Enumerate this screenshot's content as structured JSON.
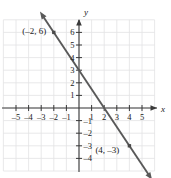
{
  "chart_data": {
    "type": "line",
    "title": "",
    "xlabel": "x",
    "ylabel": "y",
    "xlim": [
      -5.9,
      5.9
    ],
    "ylim": [
      -4.8,
      6.9
    ],
    "grid": true,
    "legend": null,
    "x_ticks": [
      -5,
      -4,
      -3,
      -2,
      -1,
      1,
      2,
      3,
      4,
      5
    ],
    "x_tick_labels": [
      "–5",
      "–4",
      "–3",
      "–2",
      "–1",
      "1",
      "2",
      "3",
      "4",
      "5"
    ],
    "y_ticks": [
      6,
      5,
      4,
      3,
      2,
      1,
      -1,
      -2,
      -3,
      -4
    ],
    "y_tick_labels": [
      "6",
      "5",
      "4",
      "3",
      "2",
      "1",
      "–1",
      "–2",
      "–3",
      "–4"
    ],
    "series": [
      {
        "name": "line",
        "kind": "line",
        "slope": -1.5,
        "intercept": 3,
        "x_start": -3.1,
        "y_start": 7.65,
        "x_end": 5.8,
        "y_end": -5.7,
        "arrows": "both",
        "color": "#595959"
      }
    ],
    "points": [
      {
        "x": -2,
        "y": 6,
        "label": "(–2, 6)",
        "label_x": -4.5,
        "label_y": 5.9
      },
      {
        "x": 4,
        "y": -3,
        "label": "(4, –3)",
        "label_x": 1.3,
        "label_y": -3.6
      }
    ],
    "annotations": []
  },
  "axes": {
    "x_axis_name": "x",
    "y_axis_name": "y"
  },
  "colors": {
    "grid": "#e2e2e4",
    "axis": "#3a3a3a",
    "line": "#5e5e5e",
    "text": "#1a1a1a",
    "background": "#ffffff"
  }
}
